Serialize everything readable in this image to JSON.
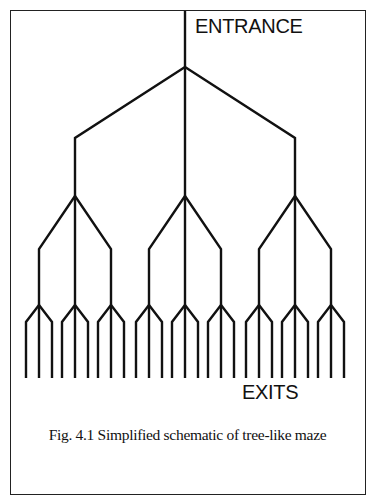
{
  "figure": {
    "entrance_label": "ENTRANCE",
    "exits_label": "EXITS",
    "caption": "Fig. 4.1 Simplified schematic of tree-like maze"
  },
  "tree": {
    "stroke_color": "#111111",
    "stroke_width": 2.4,
    "entrance": {
      "x": 185,
      "y_top": 11
    },
    "root": {
      "x": 185,
      "y": 67
    },
    "level1": {
      "y_bend": 138,
      "y_node": 196,
      "xs": [
        75,
        185,
        295
      ]
    },
    "level2": {
      "y_bend": 249,
      "y_node": 305,
      "offset": 36
    },
    "level3": {
      "y_bend": 322,
      "y_leaf": 378,
      "offset": 13
    },
    "branching_factor": 3,
    "depth": 4,
    "exit_count": 27
  }
}
